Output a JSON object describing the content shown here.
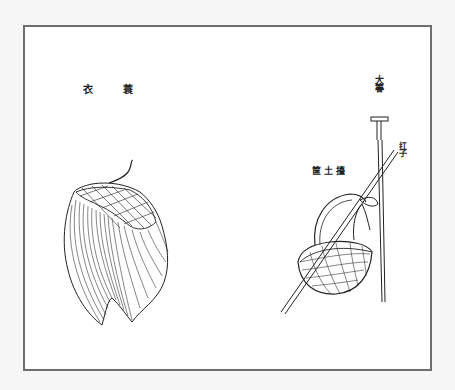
{
  "illustration": {
    "labels": {
      "raincoat_left": "衣",
      "raincoat_right": "蓑",
      "rake": "大箺",
      "pole": "扛子",
      "basket": "筐土擡"
    },
    "items": [
      {
        "id": "straw-raincoat",
        "name_zh": "蓑衣"
      },
      {
        "id": "big-rake",
        "name_zh": "大箺"
      },
      {
        "id": "carrying-pole",
        "name_zh": "扛子"
      },
      {
        "id": "earth-basket",
        "name_zh": "擡土筐"
      }
    ],
    "colors": {
      "page_bg": "#f6f6f6",
      "frame_border": "#6e6e6e",
      "ink": "#222222"
    }
  }
}
